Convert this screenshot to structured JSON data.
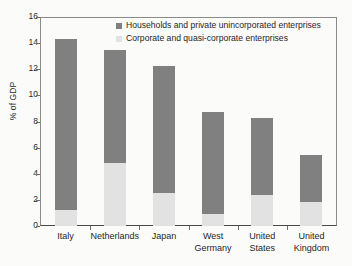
{
  "chart_data": {
    "type": "bar",
    "stacked": true,
    "title": "",
    "xlabel": "",
    "ylabel": "% of GDP",
    "ylim": [
      0,
      16
    ],
    "ytick_step": 2,
    "yticks": [
      0,
      2,
      4,
      6,
      8,
      10,
      12,
      14,
      16
    ],
    "ytick_labels": [
      "0",
      "2",
      "4",
      "6",
      "8",
      "10",
      "12",
      "14",
      "16"
    ],
    "grid": false,
    "legend_position": "top-center",
    "categories": [
      "Italy",
      "Netherlands",
      "Japan",
      "West\nGermany",
      "United\nStates",
      "United\nKingdom"
    ],
    "category_labels": [
      [
        "Italy",
        ""
      ],
      [
        "Netherlands",
        ""
      ],
      [
        "Japan",
        ""
      ],
      [
        "West",
        "Germany"
      ],
      [
        "United",
        "States"
      ],
      [
        "United",
        "Kingdom"
      ]
    ],
    "series": [
      {
        "name": "Corporate and quasi-corporate enterprises",
        "color": "#e2e2e2",
        "values": [
          1.25,
          4.8,
          2.55,
          0.9,
          2.35,
          1.85
        ]
      },
      {
        "name": "Households and private unincorporated enterprises",
        "color": "#808080",
        "values": [
          13.05,
          8.7,
          9.7,
          7.8,
          5.95,
          3.6
        ]
      }
    ],
    "totals": [
      14.3,
      13.5,
      12.25,
      8.7,
      8.3,
      5.45
    ]
  },
  "legend": {
    "items": [
      {
        "label": "Households and private unincorporated enterprises",
        "color": "#808080"
      },
      {
        "label": "Corporate and quasi-corporate enterprises",
        "color": "#e2e2e2"
      }
    ]
  },
  "axes": {
    "y_title": "% of GDP"
  }
}
